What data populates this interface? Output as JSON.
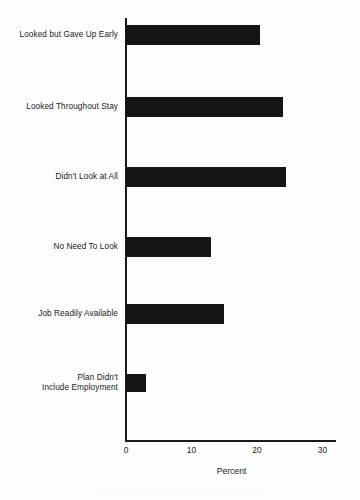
{
  "chart_data": {
    "type": "bar",
    "orientation": "horizontal",
    "title": "",
    "xlabel": "Percent",
    "ylabel": "",
    "xlim": [
      0,
      32
    ],
    "grid": false,
    "legend": null,
    "categories": [
      "Looked but Gave Up Early",
      "Looked Throughout Stay",
      "Didn't Look at All",
      "No Need To Look",
      "Job Readily Available",
      "Plan Didn't Include Employment"
    ],
    "values": [
      20.5,
      24,
      24.5,
      13,
      15,
      3
    ],
    "xticks": [
      0,
      10,
      20,
      30
    ],
    "xticklabels": [
      "0",
      "10",
      "20",
      "30"
    ],
    "bar_color": "#141414"
  },
  "axis": {
    "x_title": "Percent",
    "ticks": [
      {
        "label": "0",
        "value": 0
      },
      {
        "label": "10",
        "value": 10
      },
      {
        "label": "20",
        "value": 20
      },
      {
        "label": "30",
        "value": 30
      }
    ]
  },
  "bars": [
    {
      "label": "Looked but Gave Up Early",
      "label_line1": "Looked but Gave Up Early",
      "label_line2": "",
      "value": 20.5
    },
    {
      "label": "Looked Throughout Stay",
      "label_line1": "Looked Throughout Stay",
      "label_line2": "",
      "value": 24
    },
    {
      "label": "Didn't Look at All",
      "label_line1": "Didn't Look at All",
      "label_line2": "",
      "value": 24.5
    },
    {
      "label": "No Need To Look",
      "label_line1": "No Need To Look",
      "label_line2": "",
      "value": 13
    },
    {
      "label": "Job Readily Available",
      "label_line1": "Job Readily Available",
      "label_line2": "",
      "value": 15
    },
    {
      "label": "Plan Didn't Include Employment",
      "label_line1": "Plan Didn't",
      "label_line2": "Include Employment",
      "value": 3
    }
  ]
}
